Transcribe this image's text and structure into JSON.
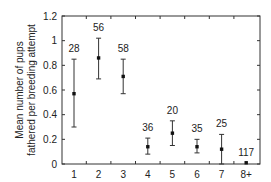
{
  "chart_data": {
    "type": "scatter",
    "title": "",
    "xlabel": "Ranked age of male",
    "ylabel": "Mean number of pups fathered per breeding attempt",
    "ylabel_lines": [
      "Mean number of pups",
      "fathered per breeding attempt"
    ],
    "categories": [
      "1",
      "2",
      "3",
      "4",
      "5",
      "6",
      "7",
      "8+"
    ],
    "values": [
      0.57,
      0.86,
      0.71,
      0.14,
      0.25,
      0.14,
      0.12,
      0.01
    ],
    "error_low": [
      0.3,
      0.69,
      0.57,
      0.08,
      0.15,
      0.09,
      0.0,
      0.01
    ],
    "error_high": [
      0.85,
      1.02,
      0.85,
      0.21,
      0.35,
      0.2,
      0.24,
      0.01
    ],
    "sample_sizes": [
      "28",
      "56",
      "58",
      "36",
      "20",
      "35",
      "25",
      "117"
    ],
    "ylim": [
      0,
      1.2
    ],
    "yticks": [
      "0",
      "0.2",
      "0.4",
      "0.6",
      "0.8",
      "1",
      "1.2"
    ],
    "grid": false,
    "legend": null
  }
}
